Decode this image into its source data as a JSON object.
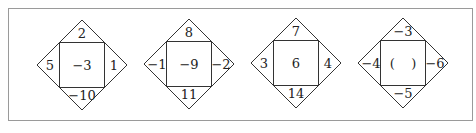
{
  "figure": {
    "type": "number-diamond-puzzle",
    "diamonds": [
      {
        "top": "2",
        "left": "5",
        "right": "1",
        "bottom": "−10",
        "center": "−3"
      },
      {
        "top": "8",
        "left": "−1",
        "right": "−2",
        "bottom": "11",
        "center": "−9"
      },
      {
        "top": "7",
        "left": "3",
        "right": "4",
        "bottom": "14",
        "center": "6"
      },
      {
        "top": "−3",
        "left": "−4",
        "right": "−6",
        "bottom": "−5",
        "center": "(    )"
      }
    ],
    "colors": {
      "line": "#333333",
      "frame": "#9a9a9a",
      "text": "#222222"
    }
  }
}
